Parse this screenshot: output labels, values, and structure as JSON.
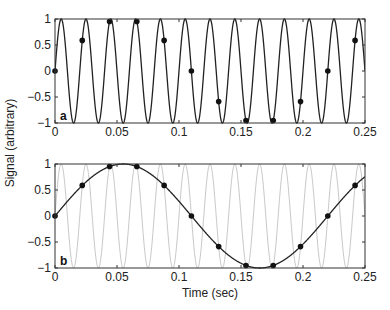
{
  "chart_data": [
    {
      "panel_label": "a",
      "type": "line",
      "title": "",
      "xlabel": "",
      "ylabel": "Signal (arbitrary)",
      "xlim": [
        0,
        0.25
      ],
      "ylim": [
        -1,
        1
      ],
      "grid": false,
      "xticks": [
        "0",
        "0.05",
        "0.1",
        "0.15",
        "0.2",
        "0.25"
      ],
      "yticks": [
        "1",
        "0.5",
        "0",
        "−0.5",
        "−1"
      ],
      "series": [
        {
          "name": "50 Hz sine",
          "style": "dark line",
          "color": "#222222",
          "frequency_hz": 50
        },
        {
          "name": "samples",
          "style": "dots",
          "color": "#111111",
          "x": [
            0,
            0.022,
            0.044,
            0.066,
            0.088,
            0.11,
            0.132,
            0.154,
            0.176,
            0.198,
            0.22,
            0.242
          ],
          "values": [
            0,
            0.588,
            0.951,
            0.951,
            0.588,
            0,
            -0.588,
            -0.951,
            -0.951,
            -0.588,
            0,
            0.588
          ]
        }
      ]
    },
    {
      "panel_label": "b",
      "type": "line",
      "title": "",
      "xlabel": "Time (sec)",
      "ylabel": "Signal (arbitrary)",
      "xlim": [
        0,
        0.25
      ],
      "ylim": [
        -1,
        1
      ],
      "grid": false,
      "xticks": [
        "0",
        "0.05",
        "0.1",
        "0.15",
        "0.2",
        "0.25"
      ],
      "yticks": [
        "1",
        "0.5",
        "0",
        "−0.5",
        "−1"
      ],
      "series": [
        {
          "name": "50 Hz sine",
          "style": "light gray line",
          "color": "#c8c8c8",
          "frequency_hz": 50
        },
        {
          "name": "4.5 Hz alias",
          "style": "dark line",
          "color": "#222222",
          "frequency_hz": 4.545
        },
        {
          "name": "samples",
          "style": "dots",
          "color": "#111111",
          "x": [
            0,
            0.022,
            0.044,
            0.066,
            0.088,
            0.11,
            0.132,
            0.154,
            0.176,
            0.198,
            0.22,
            0.242
          ],
          "values": [
            0,
            0.588,
            0.951,
            0.951,
            0.588,
            0,
            -0.588,
            -0.951,
            -0.951,
            -0.588,
            0,
            0.588
          ]
        }
      ]
    }
  ],
  "labels": {
    "ylabel": "Signal (arbitrary)",
    "xlabel": "Time (sec)",
    "panel_a": "a",
    "panel_b": "b"
  }
}
